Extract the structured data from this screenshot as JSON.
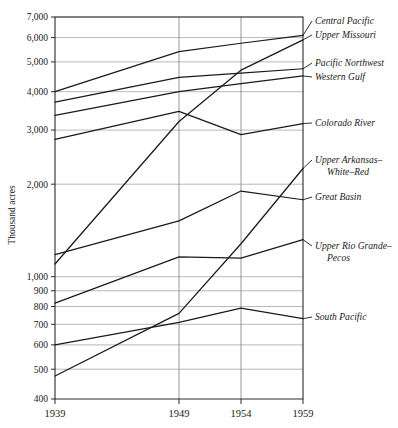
{
  "chart_data": {
    "type": "line",
    "title": "",
    "xlabel": "",
    "ylabel": "Thousand acres",
    "x": [
      1939,
      1949,
      1954,
      1959
    ],
    "xtick_labels": [
      "1939",
      "1949",
      "1954",
      "1959"
    ],
    "yscale": "log",
    "ylim": [
      400,
      7000
    ],
    "ytick_values": [
      400,
      500,
      600,
      700,
      800,
      900,
      1000,
      2000,
      3000,
      4000,
      5000,
      6000,
      7000
    ],
    "ytick_labels": [
      "400",
      "500",
      "600",
      "700",
      "800",
      "900",
      "1,000",
      "2,000",
      "3,000",
      "4,000",
      "5,000",
      "6,000",
      "7,000"
    ],
    "grid": "horizontal-and-vertical",
    "legend_position": "right-inline-labels",
    "series": [
      {
        "name": "Central Pacific",
        "values": [
          4000,
          5400,
          5750,
          6100
        ]
      },
      {
        "name": "Upper Missouri",
        "values": [
          1100,
          3200,
          4700,
          5900
        ]
      },
      {
        "name": "Pacific Northwest",
        "values": [
          3700,
          4450,
          4600,
          4750
        ]
      },
      {
        "name": "Western Gulf",
        "values": [
          3350,
          4000,
          4250,
          4500
        ]
      },
      {
        "name": "Colorado River",
        "values": [
          2800,
          3450,
          2900,
          3150
        ]
      },
      {
        "name": "Upper Arkansas–White–Red",
        "values": [
          475,
          760,
          1280,
          2250
        ]
      },
      {
        "name": "Great Basin",
        "values": [
          1180,
          1520,
          1900,
          1780
        ]
      },
      {
        "name": "Upper Rio Grande–Pecos",
        "values": [
          820,
          1160,
          1150,
          1320
        ]
      },
      {
        "name": "South Pacific",
        "values": [
          600,
          710,
          790,
          730
        ]
      }
    ],
    "series_labels": [
      {
        "text": "Central Pacific",
        "line1": "Central Pacific",
        "line2": ""
      },
      {
        "text": "Upper Missouri",
        "line1": "Upper Missouri",
        "line2": ""
      },
      {
        "text": "Pacific Northwest",
        "line1": "Pacific Northwest",
        "line2": ""
      },
      {
        "text": "Western Gulf",
        "line1": "Western Gulf",
        "line2": ""
      },
      {
        "text": "Colorado River",
        "line1": "Colorado River",
        "line2": ""
      },
      {
        "text": "Upper Arkansas–White–Red",
        "line1": "Upper Arkansas–",
        "line2": "White–Red"
      },
      {
        "text": "Great Basin",
        "line1": "Great Basin",
        "line2": ""
      },
      {
        "text": "Upper Rio Grande–Pecos",
        "line1": "Upper Rio Grande–",
        "line2": "Pecos"
      },
      {
        "text": "South Pacific",
        "line1": "South Pacific",
        "line2": ""
      }
    ],
    "colors": {
      "line": "#1a1a1a",
      "grid": "#9a9a9a",
      "axis": "#2b2b2b",
      "background": "#ffffff"
    }
  }
}
